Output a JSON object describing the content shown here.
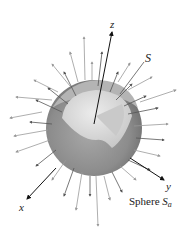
{
  "figure": {
    "labels": {
      "z_axis": "z",
      "y_axis": "y",
      "x_axis": "x",
      "surface": "S",
      "sphere_word": "Sphere ",
      "sphere_symbol": "S",
      "sphere_subscript": "a"
    },
    "colors": {
      "background": "#ffffff",
      "sphere_outer": "#8a8a8a",
      "sphere_inner": "#d8d8d8",
      "arrow_dark": "#333333",
      "arrow_light": "#9a9a9a"
    }
  }
}
